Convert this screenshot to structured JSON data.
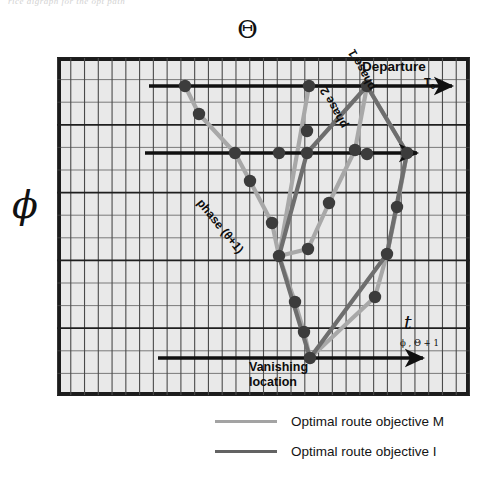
{
  "figure": {
    "faint_caption": "rice digraph for the opt path",
    "top_symbol": "Θ",
    "left_axis_label": "ϕ"
  },
  "annotations": {
    "departure": "Departure",
    "t0": "T",
    "t0_sub": "0",
    "phase1": "phase 1",
    "phase2": "phase 2",
    "phase_e1": "phase (θ+1)",
    "vanishing_line1": "Vanishing",
    "vanishing_line2": "location",
    "t_axis": "t",
    "t_axis_sub": "ϕ , Θ + 1"
  },
  "legend": {
    "items": [
      {
        "label": "Optimal route objective  M",
        "color": "#a3a3a3"
      },
      {
        "label": "Optimal route objective  I",
        "color": "#636363"
      }
    ]
  },
  "colors": {
    "frame": "#1c1c1c",
    "grid_minor": "#4a4a4a",
    "grid_major": "#1f1f1f",
    "plot_bg": "#e9e9e9",
    "node": "#3c3c3c",
    "route_m": "#a8a8a8",
    "route_i": "#6e6e6e",
    "arrow": "#101010"
  },
  "chart_data": {
    "type": "diagram",
    "title": "Θ",
    "xlabel": "t",
    "ylabel": "ϕ",
    "grid": true,
    "grid_cols": 30,
    "grid_rows": 15,
    "plot_box": {
      "x": 57,
      "y": 57,
      "w": 413,
      "h": 339
    },
    "phase_arrows": [
      {
        "name": "departure",
        "x1": 92,
        "x2": 395,
        "y": 29,
        "label": "Departure"
      },
      {
        "name": "phase-mid",
        "x1": 88,
        "x2": 360,
        "y": 96,
        "label": "phase 2"
      },
      {
        "name": "vanishing",
        "x1": 101,
        "x2": 366,
        "y": 301,
        "label": "Vanishing location"
      }
    ],
    "routes": [
      {
        "name": "Optimal route objective  M",
        "color": "#a8a8a8",
        "points": [
          [
            128,
            29
          ],
          [
            142,
            57
          ],
          [
            178,
            96
          ],
          [
            193,
            124
          ],
          [
            215,
            166
          ],
          [
            222,
            199
          ],
          [
            251,
            192
          ],
          [
            272,
            146
          ],
          [
            298,
            93
          ],
          [
            310,
            29
          ],
          [
            252,
            29
          ],
          [
            222,
            199
          ],
          [
            238,
            245
          ],
          [
            247,
            275
          ],
          [
            253,
            301
          ],
          [
            318,
            240
          ],
          [
            330,
            197
          ],
          [
            340,
            150
          ],
          [
            350,
            96
          ],
          [
            310,
            29
          ]
        ]
      },
      {
        "name": "Optimal route objective  I",
        "color": "#6e6e6e",
        "points": [
          [
            310,
            29
          ],
          [
            250,
            96
          ],
          [
            222,
            199
          ],
          [
            253,
            301
          ],
          [
            330,
            197
          ],
          [
            350,
            96
          ],
          [
            310,
            29
          ]
        ]
      }
    ],
    "nodes": [
      [
        128,
        29
      ],
      [
        252,
        29
      ],
      [
        310,
        29
      ],
      [
        142,
        57
      ],
      [
        250,
        74
      ],
      [
        298,
        93
      ],
      [
        350,
        96
      ],
      [
        178,
        96
      ],
      [
        222,
        96
      ],
      [
        272,
        146
      ],
      [
        340,
        150
      ],
      [
        193,
        124
      ],
      [
        250,
        96
      ],
      [
        310,
        97
      ],
      [
        215,
        166
      ],
      [
        330,
        197
      ],
      [
        222,
        199
      ],
      [
        251,
        192
      ],
      [
        238,
        245
      ],
      [
        318,
        240
      ],
      [
        247,
        275
      ],
      [
        253,
        301
      ]
    ]
  }
}
